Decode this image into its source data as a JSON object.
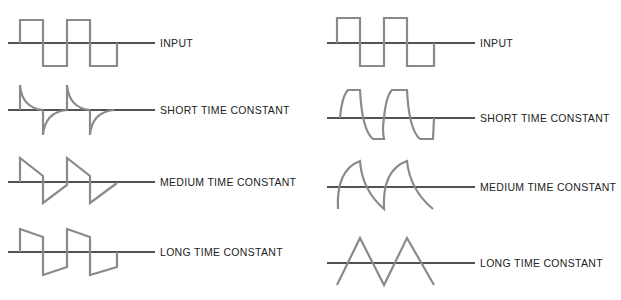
{
  "colors": {
    "axis": "#1a1a1a",
    "wave": "#8a8a8a",
    "label": "#222222"
  },
  "left_panel": {
    "title": "Differentiator (RC high-pass) outputs",
    "rows": [
      {
        "label": "INPUT"
      },
      {
        "label": "SHORT TIME CONSTANT"
      },
      {
        "label": "MEDIUM TIME CONSTANT"
      },
      {
        "label": "LONG TIME CONSTANT"
      }
    ]
  },
  "right_panel": {
    "title": "Integrator (RC low-pass) outputs",
    "rows": [
      {
        "label": "INPUT"
      },
      {
        "label": "SHORT TIME CONSTANT"
      },
      {
        "label": "MEDIUM  TIME CONSTANT"
      },
      {
        "label": "LONG TIME CONSTANT"
      }
    ]
  }
}
